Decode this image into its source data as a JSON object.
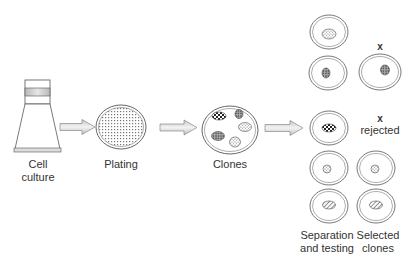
{
  "diagram": {
    "type": "process-flow",
    "stages": [
      {
        "id": "cell-culture",
        "label_line1": "Cell",
        "label_line2": "culture"
      },
      {
        "id": "plating",
        "label": "Plating"
      },
      {
        "id": "clones",
        "label": "Clones"
      },
      {
        "id": "separation",
        "label_line1": "Separation",
        "label_line2": "and testing"
      },
      {
        "id": "selected",
        "label_line1": "Selected",
        "label_line2": "clones"
      }
    ],
    "reject_marks": {
      "top": "x",
      "middle": "x"
    },
    "rejected_label": "rejected",
    "arrows": [
      {
        "from": "cell-culture",
        "to": "plating"
      },
      {
        "from": "plating",
        "to": "clones"
      },
      {
        "from": "clones",
        "to": "separation"
      }
    ],
    "colors": {
      "stroke": "#555555",
      "arrow_fill": "#d9d9d9",
      "band": "#bdbdbd",
      "background": "#ffffff"
    }
  }
}
